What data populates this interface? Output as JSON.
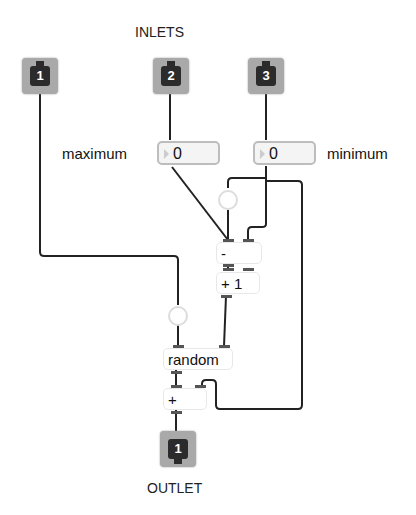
{
  "titles": {
    "inlets": "INLETS",
    "outlet": "OUTLET"
  },
  "inlets": [
    {
      "number": "1"
    },
    {
      "number": "2"
    },
    {
      "number": "3"
    }
  ],
  "outlets": [
    {
      "number": "1"
    }
  ],
  "number_boxes": {
    "maximum": {
      "label": "maximum",
      "value": "0"
    },
    "minimum": {
      "label": "minimum",
      "value": "0"
    }
  },
  "objects": {
    "subtract": "-",
    "plus_one": "+ 1",
    "random": "random",
    "add": "+"
  }
}
